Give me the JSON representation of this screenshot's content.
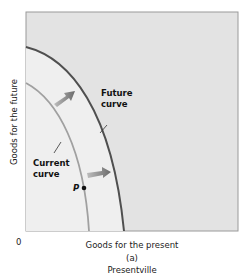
{
  "figure": {
    "y_axis_label": "Goods for the future",
    "x_axis_label": "Goods for the present",
    "origin_label": "0",
    "panel_label": "(a)",
    "caption": "Presentville",
    "curves": {
      "future_line1": "Future",
      "future_line2": "curve",
      "current_line1": "Current",
      "current_line2": "curve"
    },
    "point_label": "P",
    "colors": {
      "outer_region": "#e4e4e4",
      "inner_region": "#efefef",
      "future_curve": "#555555",
      "current_curve": "#9a9a9a",
      "arrow": "#777777",
      "frame": "#999999"
    }
  }
}
